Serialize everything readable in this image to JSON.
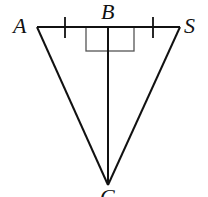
{
  "diagram": {
    "type": "geometry-triangle",
    "points": {
      "A": {
        "label": "A",
        "x": 37,
        "y": 27
      },
      "B": {
        "label": "B",
        "x": 108,
        "y": 27
      },
      "S": {
        "label": "S",
        "x": 180,
        "y": 27
      },
      "C": {
        "label": "C",
        "x": 108,
        "y": 185
      }
    },
    "segments": [
      "AS",
      "AC",
      "SC",
      "BC"
    ],
    "marks": {
      "congruent_ticks": [
        "AB",
        "BS"
      ],
      "right_angles": [
        "ABC",
        "SBC"
      ]
    },
    "colors": {
      "stroke": "#111111",
      "right_angle_box": "#555555"
    }
  }
}
